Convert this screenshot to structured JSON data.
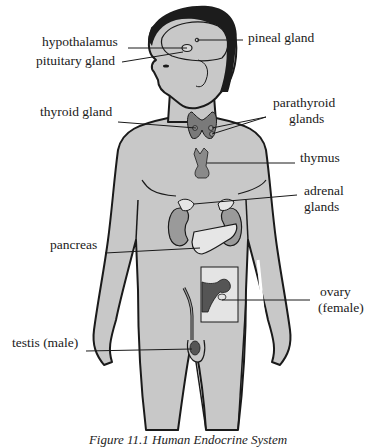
{
  "diagram": {
    "title": "Human Endocrine System",
    "caption": "Figure 11.1  Human Endocrine System",
    "colors": {
      "skin": "#c8c8c8",
      "outline": "#1a1a1a",
      "hair": "#1c1c1c",
      "gland_dark": "#7a7a7a",
      "gland_medium": "#9a9a9a",
      "pancreas": "#e6e6e6",
      "ovary_inset": "#e4e4e4",
      "ovary": "#555555"
    },
    "labels": {
      "hypothalamus": "hypothalamus",
      "pineal": "pineal gland",
      "pituitary": "pituitary gland",
      "thyroid": "thyroid gland",
      "parathyroid_1": "parathyroid",
      "parathyroid_2": "glands",
      "thymus": "thymus",
      "adrenal_1": "adrenal",
      "adrenal_2": "glands",
      "pancreas": "pancreas",
      "ovary_1": "ovary",
      "ovary_2": "(female)",
      "testis": "testis (male)"
    }
  }
}
